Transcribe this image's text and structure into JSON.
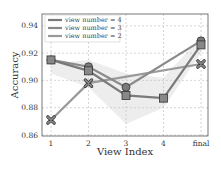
{
  "chart_data": {
    "type": "line",
    "title": "",
    "xlabel": "View Index",
    "ylabel": "Accuracy",
    "categories": [
      "1",
      "2",
      "3",
      "4",
      "final"
    ],
    "ylim": [
      0.86,
      0.95
    ],
    "yticks": [
      "0.86",
      "0.88",
      "0.90",
      "0.92",
      "0.94"
    ],
    "grid": true,
    "legend_position": "upper left",
    "series": [
      {
        "name": "view number = 4",
        "marker": "square",
        "color": "#7a7a7a",
        "values": [
          0.915,
          0.907,
          0.889,
          0.887,
          0.926
        ]
      },
      {
        "name": "view number = 3",
        "marker": "circle",
        "color": "#8a8a8a",
        "values": [
          0.915,
          0.91,
          0.895,
          null,
          0.929
        ]
      },
      {
        "name": "view number = 2",
        "marker": "x",
        "color": "#9a9a9a",
        "values": [
          0.871,
          0.898,
          null,
          null,
          0.912
        ]
      }
    ]
  },
  "legend": {
    "items": [
      "view number = 4",
      "view number = 3",
      "view number = 2"
    ]
  },
  "axes": {
    "xlabel": "View Index",
    "ylabel": "Accuracy"
  }
}
